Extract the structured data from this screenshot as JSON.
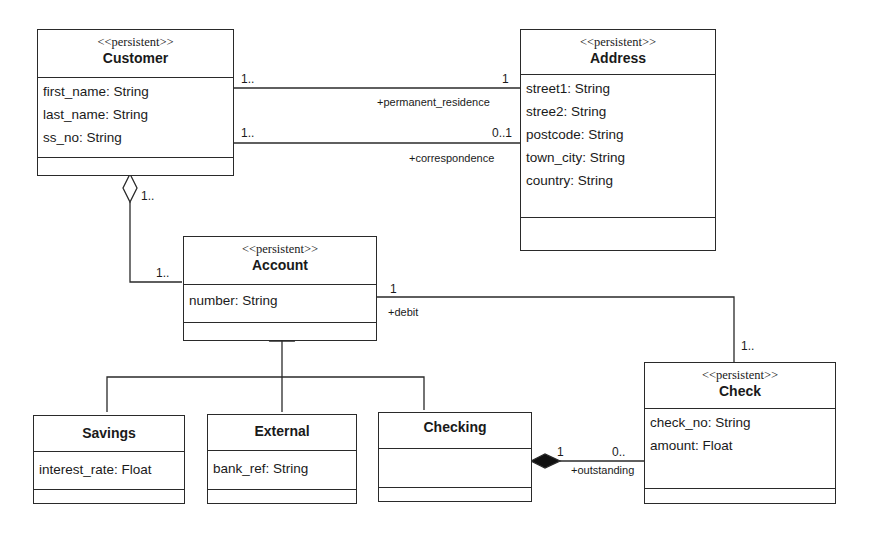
{
  "diagram": {
    "type": "UML class diagram",
    "stereotype": "<<persistent>>",
    "classes": {
      "customer": {
        "name": "Customer",
        "stereotype": "<<persistent>>",
        "attributes": [
          "first_name: String",
          "last_name: String",
          "ss_no: String"
        ]
      },
      "address": {
        "name": "Address",
        "stereotype": "<<persistent>>",
        "attributes": [
          "street1: String",
          "stree2: String",
          "postcode: String",
          "town_city: String",
          "country: String"
        ]
      },
      "account": {
        "name": "Account",
        "stereotype": "<<persistent>>",
        "attributes": [
          "number: String"
        ]
      },
      "check": {
        "name": "Check",
        "stereotype": "<<persistent>>",
        "attributes": [
          "check_no: String",
          "amount: Float"
        ]
      },
      "savings": {
        "name": "Savings",
        "attributes": [
          "interest_rate: Float"
        ]
      },
      "external": {
        "name": "External",
        "attributes": [
          "bank_ref: String"
        ]
      },
      "checking": {
        "name": "Checking",
        "attributes": []
      }
    },
    "associations": {
      "permanent_residence": {
        "from": "Customer",
        "to": "Address",
        "from_mult": "1..",
        "to_mult": "1",
        "role": "+permanent_residence"
      },
      "correspondence": {
        "from": "Customer",
        "to": "Address",
        "from_mult": "1..",
        "to_mult": "0..1",
        "role": "+correspondence"
      },
      "customer_account": {
        "kind": "aggregation",
        "whole": "Customer",
        "part": "Account",
        "whole_mult": "1..",
        "part_mult": "1.."
      },
      "debit": {
        "from": "Account",
        "to": "Check",
        "from_mult": "1",
        "to_mult": "1..",
        "role": "+debit"
      },
      "outstanding": {
        "kind": "composition",
        "whole": "Checking",
        "part": "Check",
        "whole_mult": "1",
        "part_mult": "0..",
        "role": "+outstanding"
      }
    },
    "generalization": {
      "parent": "Account",
      "children": [
        "Savings",
        "External",
        "Checking"
      ]
    }
  }
}
